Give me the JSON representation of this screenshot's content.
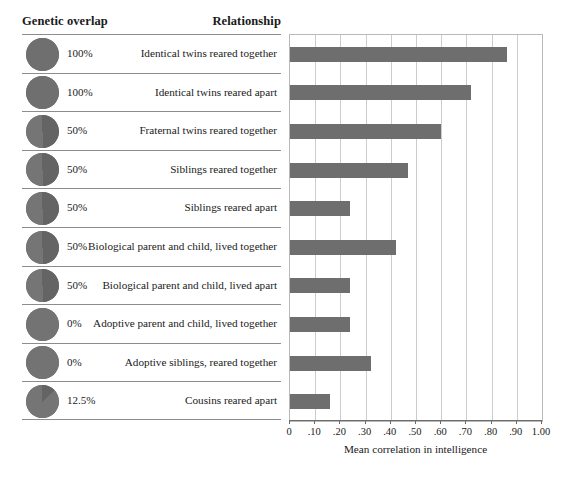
{
  "header": {
    "genetic_overlap": "Genetic overlap",
    "relationship": "Relationship"
  },
  "chart_data": {
    "type": "bar",
    "orientation": "horizontal",
    "title": "",
    "xlabel": "Mean correlation in intelligence",
    "ylabel": "",
    "xlim": [
      0,
      1.0
    ],
    "grid": true,
    "legend": "none",
    "bar_color": "#6e6e6e",
    "tick_labels": [
      "0",
      ".10",
      ".20",
      ".30",
      ".40",
      ".50",
      ".60",
      ".70",
      ".80",
      ".90",
      "1.00"
    ],
    "tick_values": [
      0,
      0.1,
      0.2,
      0.3,
      0.4,
      0.5,
      0.6,
      0.7,
      0.8,
      0.9,
      1.0
    ],
    "categories": [
      "Identical twins reared together",
      "Identical twins reared apart",
      "Fraternal twins reared together",
      "Siblings reared together",
      "Siblings reared apart",
      "Biological parent and child, lived together",
      "Biological parent and child, lived apart",
      "Adoptive parent and child, lived together",
      "Adoptive siblings, reared together",
      "Cousins reared apart"
    ],
    "values": [
      0.86,
      0.72,
      0.6,
      0.47,
      0.24,
      0.42,
      0.24,
      0.24,
      0.32,
      0.16
    ],
    "genetic_overlap": [
      "100%",
      "100%",
      "50%",
      "50%",
      "50%",
      "50%",
      "50%",
      "0%",
      "0%",
      "12.5%"
    ],
    "genetic_overlap_fraction": [
      1.0,
      1.0,
      0.5,
      0.5,
      0.5,
      0.5,
      0.5,
      0.0,
      0.0,
      0.125
    ]
  },
  "rows": [
    {
      "pct": "100%",
      "frac": 1.0,
      "label": "Identical twins reared together",
      "value": 0.86,
      "icon": "pie-icon-100"
    },
    {
      "pct": "100%",
      "frac": 1.0,
      "label": "Identical twins reared apart",
      "value": 0.72,
      "icon": "pie-icon-100"
    },
    {
      "pct": "50%",
      "frac": 0.5,
      "label": "Fraternal twins reared together",
      "value": 0.6,
      "icon": "pie-icon-50"
    },
    {
      "pct": "50%",
      "frac": 0.5,
      "label": "Siblings reared together",
      "value": 0.47,
      "icon": "pie-icon-50"
    },
    {
      "pct": "50%",
      "frac": 0.5,
      "label": "Siblings reared apart",
      "value": 0.24,
      "icon": "pie-icon-50"
    },
    {
      "pct": "50%",
      "frac": 0.5,
      "label": "Biological parent and child, lived together",
      "value": 0.42,
      "icon": "pie-icon-50"
    },
    {
      "pct": "50%",
      "frac": 0.5,
      "label": "Biological parent and child, lived apart",
      "value": 0.24,
      "icon": "pie-icon-50"
    },
    {
      "pct": "0%",
      "frac": 0.0,
      "label": "Adoptive parent and child, lived together",
      "value": 0.24,
      "icon": "pie-icon-0"
    },
    {
      "pct": "0%",
      "frac": 0.0,
      "label": "Adoptive siblings, reared together",
      "value": 0.32,
      "icon": "pie-icon-0"
    },
    {
      "pct": "12.5%",
      "frac": 0.125,
      "label": "Cousins reared apart",
      "value": 0.16,
      "icon": "pie-icon-12"
    }
  ],
  "axis": {
    "xlabel": "Mean correlation in intelligence",
    "ticks": [
      "0",
      ".10",
      ".20",
      ".30",
      ".40",
      ".50",
      ".60",
      ".70",
      ".80",
      ".90",
      "1.00"
    ]
  }
}
